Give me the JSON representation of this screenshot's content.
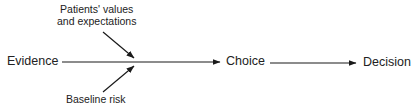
{
  "diagram": {
    "nodes": {
      "evidence": "Evidence",
      "choice": "Choice",
      "decision": "Decision"
    },
    "modifiers": {
      "values_line1": "Patients' values",
      "values_line2": "and expectations",
      "baseline": "Baseline risk"
    },
    "edges": [
      {
        "from": "Evidence",
        "to": "Choice"
      },
      {
        "from": "Choice",
        "to": "Decision"
      },
      {
        "from": "Patients' values and expectations",
        "to": "Evidence→Choice"
      },
      {
        "from": "Baseline risk",
        "to": "Evidence→Choice"
      }
    ],
    "colors": {
      "stroke": "#1a1a1a",
      "text": "#222222",
      "background": "#ffffff"
    }
  }
}
